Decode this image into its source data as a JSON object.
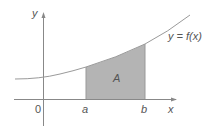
{
  "diagram": {
    "axis_x_label": "x",
    "axis_y_label": "y",
    "origin_label": "0",
    "lower_bound_label": "a",
    "upper_bound_label": "b",
    "region_label": "A",
    "curve_label": "y = f(x)",
    "colors": {
      "axis": "#888888",
      "curve": "#9a9a9a",
      "shaded_region": "#b4b4b4",
      "text": "#555555"
    }
  }
}
